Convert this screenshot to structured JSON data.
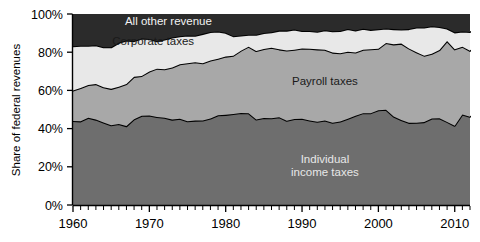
{
  "chart_data": {
    "type": "area",
    "stacked": true,
    "normalized": true,
    "title": "",
    "subtitle": "",
    "xlabel": "",
    "ylabel": "Share of federal revenues",
    "xlim": [
      1960,
      2012
    ],
    "ylim": [
      0,
      100
    ],
    "grid": false,
    "legend_position": "inline-annotations",
    "y_tick_labels": [
      "0%",
      "20%",
      "40%",
      "60%",
      "80%",
      "100%"
    ],
    "y_tick_values": [
      0,
      20,
      40,
      60,
      80,
      100
    ],
    "x_tick_labels": [
      "1960",
      "1970",
      "1980",
      "1990",
      "2000",
      "2010"
    ],
    "x_tick_values": [
      1960,
      1970,
      1980,
      1990,
      2000,
      2010
    ],
    "x_minor_tick_interval": 1,
    "x": [
      1960,
      1961,
      1962,
      1963,
      1964,
      1965,
      1966,
      1967,
      1968,
      1969,
      1970,
      1971,
      1972,
      1973,
      1974,
      1975,
      1976,
      1977,
      1978,
      1979,
      1980,
      1981,
      1982,
      1983,
      1984,
      1985,
      1986,
      1987,
      1988,
      1989,
      1990,
      1991,
      1992,
      1993,
      1994,
      1995,
      1996,
      1997,
      1998,
      1999,
      2000,
      2001,
      2002,
      2003,
      2004,
      2005,
      2006,
      2007,
      2008,
      2009,
      2010,
      2011,
      2012
    ],
    "series": [
      {
        "name": "Individual income taxes",
        "color": "#6e6e6e",
        "label_color": "#e8e8e8",
        "stack_order": 1,
        "values": [
          44.0,
          43.8,
          45.7,
          44.7,
          43.2,
          41.8,
          42.4,
          41.3,
          44.9,
          46.7,
          46.9,
          46.1,
          45.7,
          44.7,
          45.2,
          43.9,
          44.2,
          44.3,
          45.3,
          47.0,
          47.2,
          47.7,
          48.2,
          48.1,
          44.8,
          45.6,
          45.4,
          46.0,
          44.1,
          45.0,
          45.2,
          44.3,
          43.6,
          44.2,
          43.1,
          43.7,
          45.2,
          46.7,
          48.1,
          48.1,
          49.6,
          49.9,
          46.3,
          44.5,
          43.0,
          43.1,
          43.4,
          45.3,
          45.4,
          43.5,
          41.5,
          47.4,
          46.2
        ]
      },
      {
        "name": "Payroll taxes",
        "color": "#a8a8a8",
        "label_color": "#1a1a1a",
        "stack_order": 2,
        "values": [
          15.9,
          17.4,
          17.1,
          18.6,
          18.5,
          19.0,
          19.5,
          22.0,
          22.2,
          20.9,
          23.0,
          25.3,
          25.4,
          27.3,
          28.5,
          30.3,
          30.5,
          29.9,
          30.3,
          29.6,
          30.5,
          30.5,
          32.6,
          34.8,
          35.8,
          36.1,
          36.9,
          35.5,
          36.8,
          36.3,
          36.8,
          37.5,
          37.9,
          37.1,
          36.7,
          35.8,
          35.1,
          33.2,
          33.2,
          33.5,
          32.2,
          34.9,
          37.8,
          40.0,
          39.0,
          36.9,
          34.8,
          33.9,
          35.7,
          42.3,
          40.0,
          35.5,
          34.5
        ]
      },
      {
        "name": "Corporate taxes",
        "color": "#e8e8e8",
        "label_color": "#1a1a1a",
        "stack_order": 3,
        "values": [
          23.2,
          22.2,
          20.6,
          20.3,
          20.9,
          21.8,
          23.0,
          22.8,
          18.7,
          19.6,
          17.0,
          14.3,
          15.5,
          15.7,
          14.7,
          14.6,
          13.9,
          15.4,
          15.0,
          14.2,
          12.5,
          10.2,
          8.0,
          6.2,
          8.5,
          8.4,
          8.2,
          9.8,
          10.4,
          10.6,
          9.1,
          9.3,
          9.2,
          10.2,
          11.2,
          11.6,
          11.8,
          11.5,
          11.0,
          10.1,
          10.2,
          7.6,
          8.0,
          7.4,
          10.1,
          12.9,
          14.7,
          14.4,
          12.1,
          6.6,
          8.9,
          7.9,
          9.9
        ]
      },
      {
        "name": "All other revenue",
        "color": "#2b2b2b",
        "label_color": "#f2f2f2",
        "stack_order": 4,
        "values": [
          16.9,
          16.6,
          16.6,
          16.4,
          17.4,
          17.4,
          15.1,
          13.9,
          14.2,
          12.8,
          13.1,
          14.3,
          13.4,
          12.3,
          11.6,
          11.2,
          11.4,
          10.4,
          9.4,
          9.2,
          9.8,
          11.6,
          11.2,
          10.9,
          10.9,
          9.9,
          9.5,
          8.7,
          8.7,
          8.1,
          8.9,
          8.9,
          9.3,
          8.5,
          9.0,
          8.9,
          7.9,
          8.6,
          7.7,
          8.3,
          8.0,
          7.6,
          7.9,
          8.1,
          7.9,
          7.1,
          7.1,
          6.4,
          6.8,
          7.6,
          9.6,
          9.2,
          9.4
        ]
      }
    ],
    "annotations": [
      {
        "text": "All other revenue",
        "x": 1972.5,
        "y": 94.5
      },
      {
        "text": "Corporate taxes",
        "x": 1970.5,
        "y": 84.0
      },
      {
        "text": "Payroll taxes",
        "x": 1993.0,
        "y": 63.0
      },
      {
        "text": "Individual\nincome taxes",
        "x": 1993.0,
        "y": 22.0
      }
    ]
  },
  "axes": {
    "ylabel": "Share of federal revenues",
    "yticks": [
      {
        "label": "100%",
        "value": 100
      },
      {
        "label": "80%",
        "value": 80
      },
      {
        "label": "60%",
        "value": 60
      },
      {
        "label": "40%",
        "value": 40
      },
      {
        "label": "20%",
        "value": 20
      },
      {
        "label": "0%",
        "value": 0
      }
    ],
    "xticks": [
      {
        "label": "1960",
        "value": 1960
      },
      {
        "label": "1970",
        "value": 1970
      },
      {
        "label": "1980",
        "value": 1980
      },
      {
        "label": "1990",
        "value": 1990
      },
      {
        "label": "2000",
        "value": 2000
      },
      {
        "label": "2010",
        "value": 2010
      }
    ]
  },
  "labels": {
    "all_other_revenue": "All other revenue",
    "corporate_taxes": "Corporate taxes",
    "payroll_taxes": "Payroll taxes",
    "individual_income_taxes_line1": "Individual",
    "individual_income_taxes_line2": "income taxes"
  },
  "colors": {
    "individual": "#6e6e6e",
    "payroll": "#a8a8a8",
    "corporate": "#e8e8e8",
    "other": "#2b2b2b",
    "outline": "#000000",
    "background": "#ffffff"
  }
}
